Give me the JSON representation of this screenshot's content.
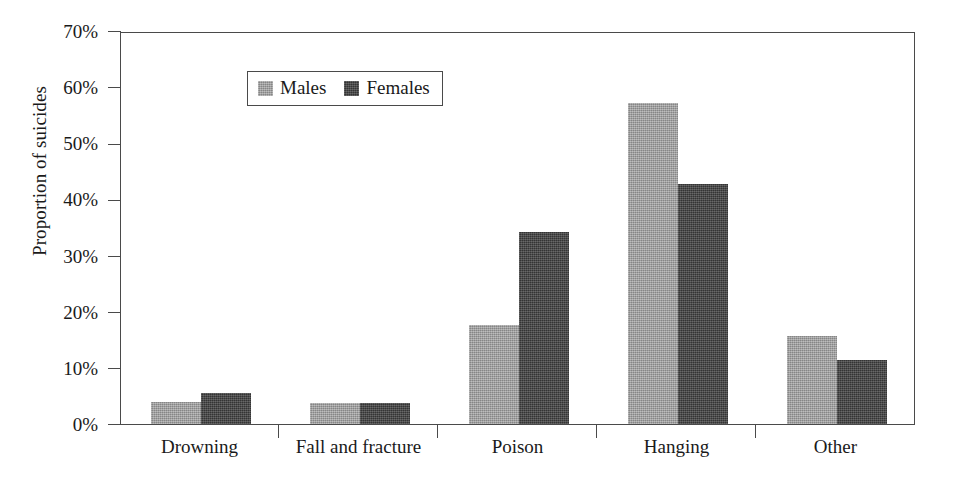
{
  "chart_data": {
    "type": "bar",
    "title": "",
    "subtitle": "",
    "xlabel": "",
    "ylabel": "Proportion of suicides",
    "categories": [
      "Drowning",
      "Fall and fracture",
      "Poison",
      "Hanging",
      "Other"
    ],
    "series": [
      {
        "name": "Males",
        "values": [
          3.9,
          3.8,
          17.6,
          57.2,
          15.6
        ]
      },
      {
        "name": "Females",
        "values": [
          5.6,
          3.7,
          34.2,
          42.8,
          11.4
        ]
      }
    ],
    "ylim": [
      0,
      70
    ],
    "ytick_labels": [
      "70%",
      "60%",
      "50%",
      "40%",
      "30%",
      "20%",
      "10%",
      "0%"
    ],
    "ytick_values": [
      70,
      60,
      50,
      40,
      30,
      20,
      10,
      0
    ],
    "grid": false,
    "legend_position": "top-left",
    "colors": {
      "males": "#9c9c9c",
      "females": "#3f3f3f",
      "axis": "#4a4a4a",
      "text": "#1a1a1a",
      "background": "#ffffff"
    }
  },
  "legend": {
    "entries": [
      {
        "label": "Males",
        "swatch": "males-swatch"
      },
      {
        "label": "Females",
        "swatch": "females-swatch"
      }
    ]
  }
}
